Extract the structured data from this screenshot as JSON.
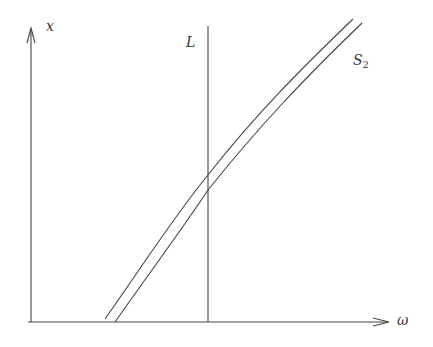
{
  "diagram": {
    "axes": {
      "x_label": "ω",
      "y_label": "x"
    },
    "vertical_line_label": "L",
    "curve_label": {
      "base": "S",
      "subscript": "2"
    },
    "colors": {
      "stroke": "#444444",
      "background": "#ffffff"
    }
  }
}
